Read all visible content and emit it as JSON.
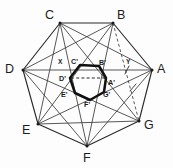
{
  "figure": {
    "shape_type": "heptagon-with-diagonals",
    "stroke_color": "#2b2b2b",
    "inner_stroke_color": "#111111",
    "background_color": "#fdfdfd"
  },
  "outer_vertices": [
    {
      "id": "A",
      "label": "A",
      "x": 152,
      "y": 70,
      "label_x": 157,
      "label_y": 63
    },
    {
      "id": "B",
      "label": "B",
      "x": 113,
      "y": 23,
      "label_x": 117,
      "label_y": 9
    },
    {
      "id": "C",
      "label": "C",
      "x": 60,
      "y": 23,
      "label_x": 45,
      "label_y": 9
    },
    {
      "id": "D",
      "label": "D",
      "x": 23,
      "y": 70,
      "label_x": 5,
      "label_y": 63
    },
    {
      "id": "E",
      "label": "E",
      "x": 38,
      "y": 124,
      "label_x": 22,
      "label_y": 124
    },
    {
      "id": "F",
      "label": "F",
      "x": 87,
      "y": 146,
      "label_x": 83,
      "label_y": 152
    },
    {
      "id": "G",
      "label": "G",
      "x": 139,
      "y": 121,
      "label_x": 144,
      "label_y": 119
    }
  ],
  "inner_vertices": [
    {
      "id": "Aprime",
      "label": "A'",
      "x": 106,
      "y": 78,
      "label_x": 108,
      "label_y": 79
    },
    {
      "id": "Bprime",
      "label": "B'",
      "x": 99,
      "y": 66,
      "label_x": 99,
      "label_y": 60
    },
    {
      "id": "Cprime",
      "label": "C'",
      "x": 80,
      "y": 65,
      "label_x": 71,
      "label_y": 59
    },
    {
      "id": "Dprime",
      "label": "D'",
      "x": 70,
      "y": 78,
      "label_x": 59,
      "label_y": 75
    },
    {
      "id": "Eprime",
      "label": "E'",
      "x": 75,
      "y": 93,
      "label_x": 61,
      "label_y": 93
    },
    {
      "id": "Fprime",
      "label": "F'",
      "x": 90,
      "y": 100,
      "label_x": 84,
      "label_y": 102
    },
    {
      "id": "Gprime",
      "label": "G'",
      "x": 104,
      "y": 92,
      "label_x": 103,
      "label_y": 92
    }
  ],
  "aux_points": [
    {
      "id": "X",
      "label": "X",
      "x": 63,
      "y": 70,
      "label_x": 58,
      "label_y": 59
    },
    {
      "id": "Y",
      "label": "Y",
      "x": 127,
      "y": 70,
      "label_x": 126,
      "label_y": 59
    }
  ],
  "outer_edges": [
    [
      "A",
      "B"
    ],
    [
      "B",
      "C"
    ],
    [
      "C",
      "D"
    ],
    [
      "D",
      "E"
    ],
    [
      "E",
      "F"
    ],
    [
      "F",
      "G"
    ],
    [
      "G",
      "A"
    ]
  ],
  "diagonals": [
    [
      "A",
      "C"
    ],
    [
      "A",
      "D"
    ],
    [
      "A",
      "E"
    ],
    [
      "A",
      "F"
    ],
    [
      "B",
      "D"
    ],
    [
      "B",
      "E"
    ],
    [
      "B",
      "F"
    ],
    [
      "C",
      "E"
    ],
    [
      "C",
      "F"
    ],
    [
      "C",
      "G"
    ],
    [
      "D",
      "F"
    ],
    [
      "D",
      "G"
    ],
    [
      "E",
      "G"
    ]
  ],
  "dashed_segments": [
    {
      "from": "B",
      "to": "G",
      "name": "dashed-diagonal-bg"
    },
    {
      "from": "Dprime",
      "to": "Aprime",
      "name": "dashed-inner-axis"
    }
  ],
  "tick_marks": [
    {
      "name": "tick-on-ga",
      "x": 133,
      "y": 87
    },
    {
      "name": "tick-on-ay",
      "x": 127,
      "y": 70
    }
  ],
  "counts": {
    "outer_vertices": 7,
    "inner_vertices": 7,
    "aux_points": 2
  }
}
